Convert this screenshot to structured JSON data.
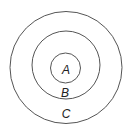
{
  "diagram": {
    "type": "concentric-circles",
    "circles": [
      {
        "label": "C",
        "cx": 66,
        "cy": 67.5,
        "r": 56
      },
      {
        "label": "B",
        "cx": 66,
        "cy": 65,
        "r": 34
      },
      {
        "label": "A",
        "cx": 65.5,
        "cy": 68,
        "r": 15
      }
    ],
    "labels": {
      "inner": "A",
      "middle": "B",
      "outer": "C"
    }
  }
}
